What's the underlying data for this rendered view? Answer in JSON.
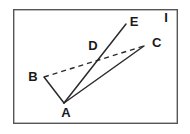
{
  "figure": {
    "frame": {
      "name": "figure-border",
      "x": 13,
      "y": 9,
      "width": 165,
      "height": 115,
      "stroke_color": "#555555",
      "stroke_width": 1.4,
      "fill_color": "#ffffff"
    },
    "points": [
      {
        "id": "A",
        "label": "A",
        "x": 64,
        "y": 103,
        "label_x": 66,
        "label_y": 117
      },
      {
        "id": "B",
        "label": "B",
        "x": 44,
        "y": 77,
        "label_x": 33,
        "label_y": 81
      },
      {
        "id": "C",
        "label": "C",
        "x": 144,
        "y": 46,
        "label_x": 152,
        "label_y": 47
      },
      {
        "id": "D",
        "label": "D",
        "x": 101,
        "y": 57,
        "label_x": 93,
        "label_y": 50
      },
      {
        "id": "E",
        "label": "E",
        "x": 126,
        "y": 24,
        "label_x": 134,
        "label_y": 26
      },
      {
        "id": "I",
        "label": "I",
        "x": 166,
        "y": 18,
        "label_x": 164,
        "label_y": 22
      }
    ],
    "segments": [
      {
        "name": "segment-A-B",
        "from": "A",
        "to": "B",
        "style": "solid",
        "stroke_color": "#2b2b2b",
        "stroke_width": 1.5
      },
      {
        "name": "segment-A-E",
        "from": "A",
        "to": "E",
        "style": "solid",
        "stroke_color": "#2b2b2b",
        "stroke_width": 1.5
      },
      {
        "name": "segment-A-C",
        "from": "A",
        "to": "C",
        "style": "solid",
        "stroke_color": "#2b2b2b",
        "stroke_width": 1.5
      },
      {
        "name": "segment-B-C",
        "from": "B",
        "to": "C",
        "style": "dashed",
        "stroke_color": "#2b2b2b",
        "stroke_width": 1.4,
        "dash_pattern": "5,4"
      }
    ],
    "labels": {
      "a": "A",
      "b": "B",
      "c": "C",
      "d": "D",
      "e": "E",
      "i": "I"
    }
  }
}
